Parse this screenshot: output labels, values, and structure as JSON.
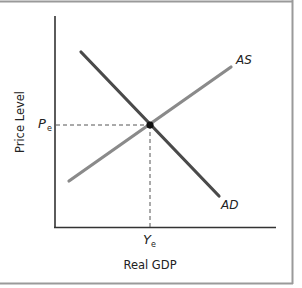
{
  "diagram": {
    "y_axis_label": "Price Level",
    "x_axis_label": "Real GDP",
    "price_equilibrium_label": {
      "main": "P",
      "sub": "e"
    },
    "output_equilibrium_label": {
      "main": "Y",
      "sub": "e"
    },
    "curves": [
      {
        "name": "AS",
        "label": "AS",
        "color": "#8a8a8a"
      },
      {
        "name": "AD",
        "label": "AD",
        "color": "#4a4a4a"
      }
    ],
    "colors": {
      "axis": "#333333",
      "border": "#9a9a9a",
      "dashed": "#555555",
      "point": "#111111"
    }
  }
}
